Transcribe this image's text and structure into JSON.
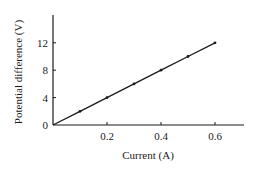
{
  "chart_data": {
    "type": "line",
    "title": "",
    "xlabel": "Current (A)",
    "ylabel": "Potential difference (V)",
    "x": [
      0,
      0.1,
      0.2,
      0.3,
      0.4,
      0.5,
      0.6
    ],
    "series": [
      {
        "name": "Potential difference",
        "values": [
          0,
          2,
          4,
          6,
          8,
          10,
          12
        ],
        "markers": true,
        "color": "#1a1a1a"
      }
    ],
    "x_ticks": [
      0.2,
      0.4,
      0.6
    ],
    "x_tick_labels": [
      "0.2",
      "0.4",
      "0.6"
    ],
    "y_ticks": [
      0,
      4,
      8,
      12
    ],
    "y_tick_labels": [
      "0",
      "4",
      "8",
      "12"
    ],
    "xlim": [
      0,
      0.7
    ],
    "ylim": [
      0,
      16
    ],
    "grid": false,
    "legend": null
  }
}
